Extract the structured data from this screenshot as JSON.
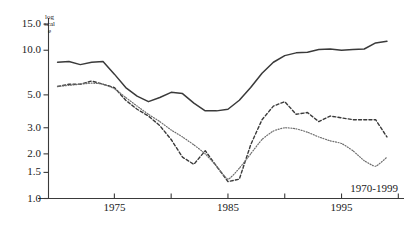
{
  "chart_data": {
    "type": "line",
    "title": "",
    "subtitle": "",
    "xlabel": "",
    "ylabel": "log scale",
    "annotation": "1970-1999",
    "grid": false,
    "legend": "none",
    "yscale": "log",
    "ylim": [
      1.0,
      16.5
    ],
    "xlim": [
      1969.2,
      2000.5
    ],
    "ytick_labels": [
      "15.0",
      "10.0",
      "5.0",
      "3.0",
      "2.0",
      "1.5",
      "1.0"
    ],
    "ytick_values": [
      15.0,
      10.0,
      5.0,
      3.0,
      2.0,
      1.5,
      1.0
    ],
    "xtick_values": [
      1975,
      1980,
      1985,
      1990,
      1995,
      2000
    ],
    "xtick_labels": [
      "1975",
      "",
      "1985",
      "",
      "1995",
      ""
    ],
    "x": [
      1970,
      1971,
      1972,
      1973,
      1974,
      1975,
      1976,
      1977,
      1978,
      1979,
      1980,
      1981,
      1982,
      1983,
      1984,
      1985,
      1986,
      1987,
      1988,
      1989,
      1990,
      1991,
      1992,
      1993,
      1994,
      1995,
      1996,
      1997,
      1998,
      1999
    ],
    "series": [
      {
        "name": "solid-series",
        "style": "solid",
        "color": "#3a3a3a",
        "values": [
          8.3,
          8.4,
          8.0,
          8.3,
          8.4,
          6.9,
          5.6,
          4.9,
          4.5,
          4.8,
          5.2,
          5.1,
          4.4,
          3.9,
          3.9,
          4.0,
          4.6,
          5.6,
          7.0,
          8.3,
          9.2,
          9.6,
          9.7,
          10.1,
          10.2,
          10.0,
          10.1,
          10.2,
          11.2,
          11.5
        ]
      },
      {
        "name": "dashed-series",
        "style": "dashed",
        "color": "#3a3a3a",
        "values": [
          5.7,
          5.9,
          5.9,
          6.2,
          5.9,
          5.6,
          4.6,
          4.0,
          3.6,
          3.1,
          2.5,
          1.9,
          1.7,
          2.1,
          1.65,
          1.3,
          1.35,
          2.3,
          3.4,
          4.2,
          4.5,
          3.7,
          3.8,
          3.3,
          3.6,
          3.5,
          3.4,
          3.4,
          3.4,
          2.6
        ]
      },
      {
        "name": "dotted-series",
        "style": "dotted",
        "color": "#6e6e6e",
        "values": [
          5.7,
          5.8,
          5.9,
          6.0,
          5.9,
          5.5,
          4.8,
          4.2,
          3.7,
          3.3,
          2.9,
          2.6,
          2.3,
          2.0,
          1.65,
          1.35,
          1.6,
          2.0,
          2.5,
          2.85,
          3.0,
          2.95,
          2.8,
          2.6,
          2.45,
          2.35,
          2.1,
          1.8,
          1.65,
          1.9
        ]
      }
    ]
  }
}
